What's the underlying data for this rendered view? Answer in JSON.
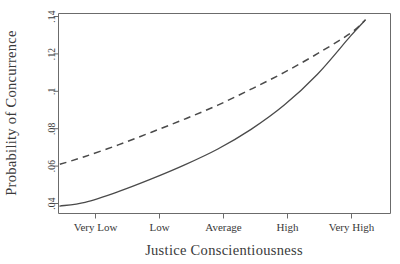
{
  "chart_data": {
    "type": "line",
    "title": "",
    "subtitle": "",
    "xlabel": "Justice Conscientiousness",
    "ylabel": "Probability of Concurrence",
    "categories": [
      "Very Low",
      "Low",
      "Average",
      "High",
      "Very High"
    ],
    "x": [
      1,
      2,
      3,
      4,
      5
    ],
    "xlim": [
      0.6,
      5.6
    ],
    "ylim": [
      0.0375,
      0.1445
    ],
    "yticks": [
      0.04,
      0.06,
      0.08,
      0.1,
      0.12,
      0.14
    ],
    "ytick_labels": [
      ".04",
      ".06",
      ".08",
      ".1",
      ".12",
      ".14"
    ],
    "xtick_labels": [
      "Very Low",
      "Low",
      "Average",
      "High",
      "Very High"
    ],
    "grid": false,
    "legend": "none",
    "series": [
      {
        "name": "solid-curve",
        "style": "solid",
        "color": "#4a4a4a",
        "values": [
          0.0435,
          0.056,
          0.072,
          0.0955,
          0.1325
        ],
        "points": [
          {
            "x": 0.62,
            "y": 0.0415
          },
          {
            "x": 1.0,
            "y": 0.0435
          },
          {
            "x": 1.5,
            "y": 0.0492
          },
          {
            "x": 2.0,
            "y": 0.056
          },
          {
            "x": 2.5,
            "y": 0.0635
          },
          {
            "x": 3.0,
            "y": 0.072
          },
          {
            "x": 3.5,
            "y": 0.0825
          },
          {
            "x": 4.0,
            "y": 0.0955
          },
          {
            "x": 4.5,
            "y": 0.112
          },
          {
            "x": 5.0,
            "y": 0.1325
          },
          {
            "x": 5.22,
            "y": 0.141
          }
        ]
      },
      {
        "name": "dashed-curve",
        "style": "dashed",
        "color": "#4a4a4a",
        "values": [
          0.068,
          0.081,
          0.0955,
          0.113,
          0.134
        ],
        "points": [
          {
            "x": 0.62,
            "y": 0.0638
          },
          {
            "x": 1.0,
            "y": 0.068
          },
          {
            "x": 1.5,
            "y": 0.0742
          },
          {
            "x": 2.0,
            "y": 0.081
          },
          {
            "x": 2.5,
            "y": 0.088
          },
          {
            "x": 3.0,
            "y": 0.0955
          },
          {
            "x": 3.5,
            "y": 0.104
          },
          {
            "x": 4.0,
            "y": 0.113
          },
          {
            "x": 4.5,
            "y": 0.123
          },
          {
            "x": 5.0,
            "y": 0.134
          },
          {
            "x": 5.22,
            "y": 0.141
          }
        ]
      }
    ],
    "colors": {
      "axis": "#6b6b6b",
      "line": "#4a4a4a",
      "text": "#3a3a3a",
      "background": "#ffffff"
    }
  },
  "axes": {
    "y_title": "Probability of Concurrence",
    "x_title": "Justice Conscientiousness",
    "y_tick_0": ".04",
    "y_tick_1": ".06",
    "y_tick_2": ".08",
    "y_tick_3": ".1",
    "y_tick_4": ".12",
    "y_tick_5": ".14",
    "x_tick_0": "Very Low",
    "x_tick_1": "Low",
    "x_tick_2": "Average",
    "x_tick_3": "High",
    "x_tick_4": "Very High"
  }
}
